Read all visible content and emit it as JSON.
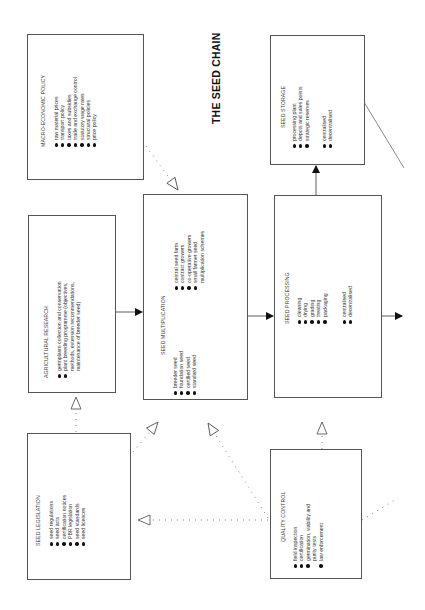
{
  "title": "THE SEED CHAIN",
  "boxes": {
    "macro": {
      "title": "MACRO-ECONOMIC POLICY",
      "items": [
        "raw material prices",
        "transport policy",
        "taxes and subsidies",
        "trade and exchange control",
        "statutory wage rates",
        "structural policies",
        "price policy"
      ]
    },
    "research": {
      "title": "AGRICULTURAL RESEARCH",
      "items": [
        "germplasm collection and conservation",
        "plant breeding programme (objectives,",
        "methods, extension recommendations,",
        "maintenance of breeder seed)"
      ]
    },
    "legislation": {
      "title": "SEED LEGISLATION",
      "items": [
        "seed regulations",
        "seed acts",
        "certification notices",
        "PBR legislation",
        "seed standards",
        "seed licences"
      ]
    },
    "multiplication": {
      "title": "SEED MULTIPLICATION",
      "group1": [
        "breeder seed",
        "foundation seed",
        "certified seed",
        "standard seed"
      ],
      "group2": [
        "central seed farm",
        "contract growers",
        "co-operative growers",
        "small farmer seed",
        "multiplication schemes"
      ]
    },
    "processing": {
      "title": "SEED PROCESSING",
      "group1": [
        "cleaning",
        "drying",
        "grading",
        "treating",
        "packaging"
      ],
      "group2": [
        "centralised",
        "decentralised"
      ]
    },
    "storage": {
      "title": "SEED STORAGE",
      "group1": [
        "processing plant",
        "depots and sales points",
        "strategic reserves"
      ],
      "group2": [
        "centralised",
        "decentralised"
      ]
    },
    "quality": {
      "title": "QUALITY CONTROL",
      "items": [
        "field inspection",
        "certification",
        "germination, viability and",
        "purity tests",
        "law enforcement"
      ]
    }
  }
}
